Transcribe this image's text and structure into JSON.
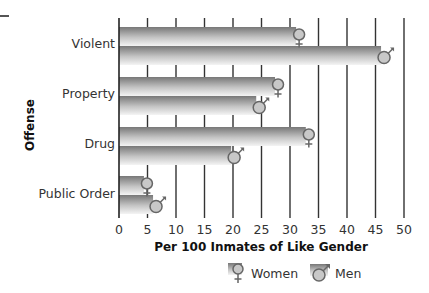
{
  "chart_data": {
    "type": "bar",
    "orientation": "horizontal",
    "title": "",
    "categories": [
      "Violent",
      "Property",
      "Drug",
      "Public Order"
    ],
    "series": [
      {
        "name": "Women",
        "symbol": "female-symbol",
        "values": [
          31.6,
          27.9,
          33.3,
          4.9
        ]
      },
      {
        "name": "Men",
        "symbol": "male-symbol",
        "values": [
          46.5,
          24.6,
          20.2,
          6.5
        ]
      }
    ],
    "xlabel": "Per 100 Inmates of Like Gender",
    "ylabel": "Offense",
    "xlim": [
      0,
      50
    ],
    "xticks": [
      0,
      5,
      10,
      15,
      20,
      25,
      30,
      35,
      40,
      45,
      50
    ],
    "grid": "vertical",
    "legend_position": "bottom"
  },
  "labels": {
    "y_title": "Offense",
    "x_title": "Per 100 Inmates of Like Gender",
    "categories": [
      "Violent",
      "Property",
      "Drug",
      "Public Order"
    ],
    "ticks": [
      "0",
      "5",
      "10",
      "15",
      "20",
      "25",
      "30",
      "35",
      "40",
      "45",
      "50"
    ]
  },
  "legend": {
    "women": "Women",
    "men": "Men"
  },
  "colors": {
    "bar_dark": "#7a7a7a",
    "bar_light": "#f2f2f2",
    "grid": "#333333",
    "symbol_fill": "#c8c8c8",
    "symbol_stroke": "#666666"
  }
}
